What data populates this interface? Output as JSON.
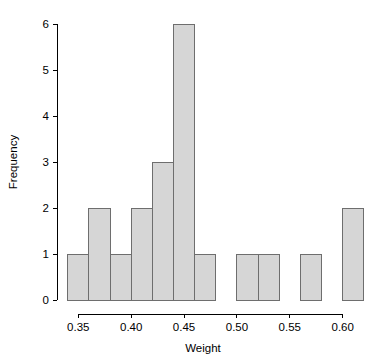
{
  "chart_data": {
    "type": "bar",
    "title": "",
    "subtitle": "",
    "xlabel": "Weight",
    "ylabel": "Frequency",
    "xlim": [
      0.338,
      0.622
    ],
    "ylim": [
      0,
      6
    ],
    "grid": false,
    "legend": null,
    "bin_width": 0.02,
    "bin_edges": [
      0.34,
      0.36,
      0.38,
      0.4,
      0.42,
      0.44,
      0.46,
      0.48,
      0.5,
      0.52,
      0.54,
      0.56,
      0.58,
      0.6,
      0.62
    ],
    "categories": [
      "0.34-0.36",
      "0.36-0.38",
      "0.38-0.40",
      "0.40-0.42",
      "0.42-0.44",
      "0.44-0.46",
      "0.46-0.48",
      "0.48-0.50",
      "0.50-0.52",
      "0.52-0.54",
      "0.54-0.56",
      "0.56-0.58",
      "0.58-0.60",
      "0.60-0.62"
    ],
    "values": [
      1,
      2,
      1,
      2,
      3,
      6,
      1,
      0,
      1,
      1,
      0,
      1,
      0,
      2
    ],
    "bars": [
      {
        "x0": 0.34,
        "x1": 0.36,
        "count": 1
      },
      {
        "x0": 0.36,
        "x1": 0.38,
        "count": 2
      },
      {
        "x0": 0.38,
        "x1": 0.4,
        "count": 1
      },
      {
        "x0": 0.4,
        "x1": 0.42,
        "count": 2
      },
      {
        "x0": 0.42,
        "x1": 0.44,
        "count": 3
      },
      {
        "x0": 0.44,
        "x1": 0.46,
        "count": 6
      },
      {
        "x0": 0.46,
        "x1": 0.48,
        "count": 1
      },
      {
        "x0": 0.48,
        "x1": 0.5,
        "count": 0
      },
      {
        "x0": 0.5,
        "x1": 0.52,
        "count": 1
      },
      {
        "x0": 0.52,
        "x1": 0.54,
        "count": 1
      },
      {
        "x0": 0.54,
        "x1": 0.56,
        "count": 0
      },
      {
        "x0": 0.56,
        "x1": 0.58,
        "count": 1
      },
      {
        "x0": 0.58,
        "x1": 0.6,
        "count": 0
      },
      {
        "x0": 0.6,
        "x1": 0.62,
        "count": 2
      }
    ],
    "x_ticks": [
      {
        "value": 0.35,
        "label": "0.35"
      },
      {
        "value": 0.4,
        "label": "0.40"
      },
      {
        "value": 0.45,
        "label": "0.45"
      },
      {
        "value": 0.5,
        "label": "0.50"
      },
      {
        "value": 0.55,
        "label": "0.55"
      },
      {
        "value": 0.6,
        "label": "0.60"
      }
    ],
    "y_ticks": [
      {
        "value": 0,
        "label": "0"
      },
      {
        "value": 1,
        "label": "1"
      },
      {
        "value": 2,
        "label": "2"
      },
      {
        "value": 3,
        "label": "3"
      },
      {
        "value": 4,
        "label": "4"
      },
      {
        "value": 5,
        "label": "5"
      },
      {
        "value": 6,
        "label": "6"
      }
    ],
    "colors": {
      "bar_fill": "#d6d6d6",
      "bar_stroke": "#6e6e6e",
      "axis": "#000000",
      "text": "#000000",
      "background": "#ffffff"
    }
  }
}
